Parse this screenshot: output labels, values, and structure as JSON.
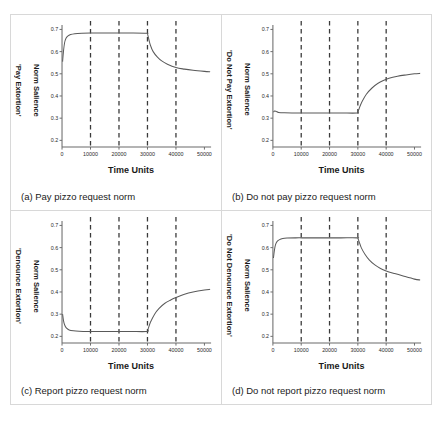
{
  "figure": {
    "panels": [
      {
        "key": "a",
        "caption": "(a) Pay pizzo request norm",
        "ylabel": "'Pay Extortion'\nNorm Salience",
        "ylabel_line1": "'Pay Extortion'",
        "ylabel_line2": "Norm Salience",
        "xlabel": "Time Units"
      },
      {
        "key": "b",
        "caption": "(b) Do not pay pizzo request norm",
        "ylabel_line1": "'Do Not Pay Extortion'",
        "ylabel_line2": "Norm Salience",
        "xlabel": "Time Units"
      },
      {
        "key": "c",
        "caption": "(c) Report pizzo request norm",
        "ylabel_line1": "'Denounce Extortion'",
        "ylabel_line2": "Norm Salience",
        "xlabel": "Time Units"
      },
      {
        "key": "d",
        "caption": "(d) Do not report pizzo request norm",
        "ylabel_line1": "'Do Not Denounce Extortion'",
        "ylabel_line2": "Norm Salience",
        "xlabel": "Time Units"
      }
    ]
  },
  "chart_data": [
    {
      "type": "line",
      "panel": "a",
      "title": "(a) Pay pizzo request norm",
      "xlabel": "Time Units",
      "ylabel": "'Pay Extortion' Norm Salience",
      "xlim": [
        0,
        52000
      ],
      "ylim": [
        0.17,
        0.72
      ],
      "xticks": [
        0,
        10000,
        20000,
        30000,
        40000,
        50000
      ],
      "xticklabels": [
        "0",
        "10000",
        "20000",
        "30000",
        "40000",
        "50000"
      ],
      "yticks": [
        0.2,
        0.3,
        0.4,
        0.5,
        0.6,
        0.7
      ],
      "yticklabels": [
        "0.2",
        "0.3",
        "0.4",
        "0.5",
        "0.6",
        "0.7"
      ],
      "grid": false,
      "legend": null,
      "vertical_dashed_lines": [
        10000,
        20000,
        30000,
        40000
      ],
      "series": [
        {
          "name": "Pay Extortion norm salience",
          "x": [
            200,
            500,
            900,
            1400,
            2000,
            3000,
            4500,
            7000,
            10000,
            15000,
            20000,
            25000,
            29800,
            30000,
            30400,
            31000,
            32000,
            33500,
            35000,
            37000,
            40000,
            43000,
            46000,
            50000,
            52000
          ],
          "y": [
            0.555,
            0.6,
            0.64,
            0.66,
            0.67,
            0.677,
            0.681,
            0.683,
            0.684,
            0.684,
            0.684,
            0.684,
            0.683,
            0.681,
            0.66,
            0.63,
            0.6,
            0.575,
            0.558,
            0.543,
            0.528,
            0.521,
            0.516,
            0.511,
            0.509
          ]
        }
      ]
    },
    {
      "type": "line",
      "panel": "b",
      "title": "(b) Do not pay pizzo request norm",
      "xlabel": "Time Units",
      "ylabel": "'Do Not Pay Extortion' Norm Salience",
      "xlim": [
        0,
        52000
      ],
      "ylim": [
        0.17,
        0.72
      ],
      "xticks": [
        0,
        10000,
        20000,
        30000,
        40000,
        50000
      ],
      "xticklabels": [
        "0",
        "10000",
        "20000",
        "30000",
        "40000",
        "50000"
      ],
      "yticks": [
        0.2,
        0.3,
        0.4,
        0.5,
        0.6,
        0.7
      ],
      "yticklabels": [
        "0.2",
        "0.3",
        "0.4",
        "0.5",
        "0.6",
        "0.7"
      ],
      "grid": false,
      "legend": null,
      "vertical_dashed_lines": [
        10000,
        20000,
        30000,
        40000
      ],
      "series": [
        {
          "name": "Do Not Pay Extortion norm salience",
          "x": [
            200,
            600,
            1200,
            2000,
            4000,
            8000,
            12000,
            18000,
            24000,
            29800,
            30000,
            30500,
            31500,
            33000,
            35000,
            37000,
            39000,
            41000,
            44000,
            47000,
            50000,
            52000
          ],
          "y": [
            0.327,
            0.332,
            0.33,
            0.326,
            0.324,
            0.323,
            0.323,
            0.323,
            0.323,
            0.323,
            0.327,
            0.345,
            0.375,
            0.408,
            0.436,
            0.456,
            0.47,
            0.48,
            0.489,
            0.495,
            0.5,
            0.502
          ]
        }
      ]
    },
    {
      "type": "line",
      "panel": "c",
      "title": "(c) Report pizzo request norm",
      "xlabel": "Time Units",
      "ylabel": "'Denounce Extortion' Norm Salience",
      "xlim": [
        0,
        52000
      ],
      "ylim": [
        0.17,
        0.72
      ],
      "xticks": [
        0,
        10000,
        20000,
        30000,
        40000,
        50000
      ],
      "xticklabels": [
        "0",
        "10000",
        "20000",
        "30000",
        "40000",
        "50000"
      ],
      "yticks": [
        0.2,
        0.3,
        0.4,
        0.5,
        0.6,
        0.7
      ],
      "yticklabels": [
        "0.2",
        "0.3",
        "0.4",
        "0.5",
        "0.6",
        "0.7"
      ],
      "grid": false,
      "legend": null,
      "vertical_dashed_lines": [
        10000,
        20000,
        30000,
        40000
      ],
      "series": [
        {
          "name": "Denounce Extortion norm salience",
          "x": [
            200,
            500,
            900,
            1500,
            2500,
            4000,
            6000,
            9000,
            13000,
            18000,
            24000,
            29800,
            30200,
            31000,
            32500,
            34000,
            36000,
            38000,
            40000,
            43000,
            46000,
            50000,
            52000
          ],
          "y": [
            0.3,
            0.272,
            0.252,
            0.238,
            0.229,
            0.225,
            0.223,
            0.222,
            0.222,
            0.222,
            0.222,
            0.222,
            0.232,
            0.262,
            0.3,
            0.325,
            0.348,
            0.363,
            0.375,
            0.39,
            0.4,
            0.409,
            0.412
          ]
        }
      ]
    },
    {
      "type": "line",
      "panel": "d",
      "title": "(d) Do not report pizzo request norm",
      "xlabel": "Time Units",
      "ylabel": "'Do Not Denounce Extortion' Norm Salience",
      "xlim": [
        0,
        52000
      ],
      "ylim": [
        0.17,
        0.72
      ],
      "xticks": [
        0,
        10000,
        20000,
        30000,
        40000,
        50000
      ],
      "xticklabels": [
        "0",
        "10000",
        "20000",
        "30000",
        "40000",
        "50000"
      ],
      "yticks": [
        0.2,
        0.3,
        0.4,
        0.5,
        0.6,
        0.7
      ],
      "yticklabels": [
        "0.2",
        "0.3",
        "0.4",
        "0.5",
        "0.6",
        "0.7"
      ],
      "grid": false,
      "legend": null,
      "vertical_dashed_lines": [
        10000,
        20000,
        30000,
        40000
      ],
      "series": [
        {
          "name": "Do Not Denounce Extortion norm salience",
          "x": [
            200,
            500,
            900,
            1500,
            2200,
            3500,
            5000,
            8000,
            12000,
            18000,
            24000,
            29800,
            30000,
            30500,
            31200,
            32500,
            34000,
            36000,
            38000,
            40000,
            43000,
            46000,
            50000,
            52000
          ],
          "y": [
            0.553,
            0.585,
            0.612,
            0.628,
            0.635,
            0.641,
            0.643,
            0.644,
            0.644,
            0.644,
            0.644,
            0.644,
            0.642,
            0.625,
            0.6,
            0.57,
            0.545,
            0.522,
            0.506,
            0.495,
            0.483,
            0.472,
            0.458,
            0.454
          ]
        }
      ]
    }
  ],
  "colors": {
    "curve": "#595959",
    "axis": "#6b6b6b",
    "dashed": "#3a3a3a",
    "panel_border": "#d8d8d8",
    "text": "#1a1a1a",
    "background": "#ffffff"
  }
}
